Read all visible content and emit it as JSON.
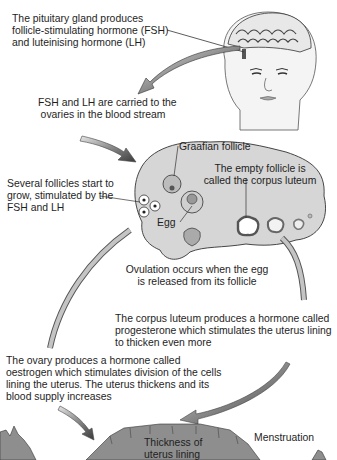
{
  "diagram": {
    "colors": {
      "ink": "#1e1e1e",
      "ovary_fill": "#d6d6d6",
      "uterus_fill": "#8e8e8e",
      "arrow_fill": "#9a9a9a",
      "background": "#ffffff"
    },
    "labels": {
      "pituitary": [
        "The pituitary gland produces",
        "follicle-stimulating hormone (FSH)",
        "and luteinising hormone (LH)"
      ],
      "blood_stream": [
        "FSH and LH are carried to the",
        "ovaries in the blood stream"
      ],
      "graafian": "Graafian follicle",
      "corpus_luteum": [
        "The empty follicle is",
        "called the corpus luteum"
      ],
      "follicles_grow": [
        "Several follicles start to",
        "grow, stimulated by the",
        "FSH and LH"
      ],
      "egg": "Egg",
      "ovulation": [
        "Ovulation occurs when the egg",
        "is released from its follicle"
      ],
      "progesterone": [
        "The corpus luteum produces a hormone called",
        "progesterone which stimulates the uterus lining",
        "to thicken even more"
      ],
      "oestrogen": [
        "The ovary produces a hormone called",
        "oestrogen which stimulates division of the cells",
        "lining the uterus. The uterus thickens and its",
        "blood supply increases"
      ],
      "thickness": [
        "Thickness of",
        "uterus lining"
      ],
      "menstruation": "Menstruation"
    },
    "illustrations": [
      "head-with-brain",
      "ovary",
      "uterus-lining"
    ]
  }
}
